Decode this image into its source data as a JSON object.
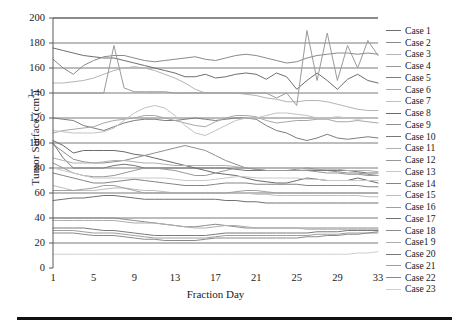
{
  "chart_data": {
    "type": "line",
    "title": "",
    "xlabel": "Fraction Day",
    "ylabel": "Tumor Surface (cm2)",
    "ylabel_display": "Tumor Surface (cm",
    "ylabel_sup": "2",
    "ylabel_tail": ")",
    "xlim": [
      1,
      33
    ],
    "ylim": [
      0,
      200
    ],
    "grid": true,
    "grid_orientation": "horizontal",
    "legend_position": "right",
    "x_ticks": [
      1,
      5,
      9,
      13,
      17,
      21,
      25,
      29,
      33
    ],
    "y_ticks": [
      0,
      20,
      40,
      60,
      80,
      100,
      120,
      140,
      160,
      180,
      200
    ],
    "x": [
      1,
      2,
      3,
      4,
      5,
      6,
      7,
      8,
      9,
      10,
      11,
      12,
      13,
      14,
      15,
      16,
      17,
      18,
      19,
      20,
      21,
      22,
      23,
      24,
      25,
      26,
      27,
      28,
      29,
      30,
      31,
      32,
      33
    ],
    "series": [
      {
        "name": "Case 1",
        "color": "#6e6e6e",
        "values": [
          176,
          174,
          172,
          170,
          169,
          168,
          168,
          166,
          164,
          162,
          160,
          158,
          156,
          153,
          153,
          155,
          152,
          153,
          155,
          156,
          155,
          151,
          156,
          153,
          143,
          150,
          156,
          150,
          143,
          151,
          155,
          150,
          148
        ]
      },
      {
        "name": "Case 2",
        "color": "#8a8a8a",
        "values": [
          167,
          160,
          155,
          162,
          166,
          169,
          170,
          170,
          168,
          166,
          165,
          166,
          167,
          168,
          169,
          167,
          166,
          168,
          170,
          171,
          170,
          168,
          166,
          164,
          165,
          168,
          170,
          171,
          172,
          172,
          171,
          172,
          171
        ]
      },
      {
        "name": "Case 3",
        "color": "#b4b4b4",
        "values": [
          148,
          148,
          149,
          150,
          152,
          155,
          158,
          160,
          161,
          160,
          158,
          155,
          152,
          148,
          143,
          140,
          140,
          140,
          140,
          139,
          138,
          136,
          135,
          133,
          133,
          134,
          134,
          133,
          131,
          129,
          127,
          126,
          126
        ]
      },
      {
        "name": "Case 4",
        "color": "#9a9a9a",
        "values": [
          140,
          140,
          140,
          140,
          140,
          140,
          178,
          144,
          141,
          141,
          141,
          141,
          140,
          140,
          140,
          140,
          140,
          140,
          140,
          140,
          140,
          140,
          136,
          140,
          130,
          190,
          150,
          188,
          150,
          178,
          160,
          182,
          170
        ]
      },
      {
        "name": "Case 5",
        "color": "#7d7d7d",
        "values": [
          120,
          119,
          118,
          114,
          112,
          110,
          113,
          116,
          118,
          119,
          119,
          118,
          118,
          119,
          120,
          119,
          118,
          119,
          120,
          120,
          119,
          114,
          110,
          108,
          104,
          102,
          104,
          107,
          104,
          103,
          104,
          105,
          104
        ]
      },
      {
        "name": "Case 6",
        "color": "#a8a8a8",
        "values": [
          108,
          110,
          111,
          112,
          113,
          116,
          118,
          119,
          120,
          122,
          122,
          120,
          118,
          116,
          114,
          113,
          117,
          120,
          122,
          122,
          121,
          118,
          116,
          117,
          118,
          118,
          119,
          119,
          117,
          117,
          118,
          117,
          116
        ]
      },
      {
        "name": "Case 7",
        "color": "#c2c2c2",
        "values": [
          110,
          109,
          108,
          108,
          108,
          109,
          112,
          118,
          124,
          128,
          130,
          128,
          122,
          114,
          108,
          106,
          110,
          114,
          118,
          120,
          120,
          122,
          124,
          124,
          123,
          122,
          120,
          120,
          121,
          120,
          119,
          120,
          120
        ]
      },
      {
        "name": "Case 8",
        "color": "#6a6a6a",
        "values": [
          102,
          98,
          92,
          94,
          94,
          94,
          94,
          93,
          91,
          90,
          88,
          86,
          84,
          82,
          80,
          78,
          76,
          75,
          74,
          72,
          70,
          69,
          68,
          68,
          70,
          72,
          71,
          70,
          70,
          70,
          72,
          70,
          68
        ]
      },
      {
        "name": "Case 9",
        "color": "#8f8f8f",
        "values": [
          99,
          93,
          87,
          85,
          84,
          84,
          85,
          86,
          88,
          90,
          92,
          94,
          96,
          98,
          96,
          94,
          90,
          86,
          83,
          80,
          79,
          78,
          78,
          78,
          79,
          80,
          79,
          78,
          77,
          76,
          76,
          75,
          74
        ]
      },
      {
        "name": "Case 10",
        "color": "#777777",
        "values": [
          100,
          88,
          80,
          80,
          80,
          80,
          82,
          83,
          82,
          80,
          80,
          80,
          80,
          80,
          80,
          80,
          80,
          80,
          79,
          78,
          78,
          78,
          78,
          78,
          78,
          78,
          78,
          78,
          78,
          78,
          77,
          76,
          76
        ]
      },
      {
        "name": "Case 11",
        "color": "#b0b0b0",
        "values": [
          88,
          86,
          84,
          84,
          84,
          85,
          86,
          86,
          85,
          84,
          84,
          83,
          82,
          82,
          82,
          82,
          82,
          82,
          81,
          80,
          80,
          80,
          80,
          80,
          80,
          79,
          79,
          79,
          79,
          78,
          78,
          78,
          77
        ]
      },
      {
        "name": "Case 12",
        "color": "#989898",
        "values": [
          84,
          80,
          76,
          74,
          73,
          73,
          74,
          76,
          78,
          80,
          80,
          79,
          78,
          76,
          74,
          74,
          76,
          78,
          80,
          80,
          79,
          78,
          78,
          78,
          78,
          78,
          77,
          76,
          76,
          75,
          75,
          74,
          74
        ]
      },
      {
        "name": "Case 13",
        "color": "#c8c8c8",
        "values": [
          80,
          78,
          76,
          74,
          72,
          72,
          72,
          72,
          72,
          72,
          72,
          72,
          71,
          70,
          70,
          70,
          71,
          72,
          73,
          73,
          72,
          72,
          72,
          72,
          72,
          71,
          71,
          70,
          70,
          70,
          70,
          70,
          70
        ]
      },
      {
        "name": "Case 14",
        "color": "#858585",
        "values": [
          76,
          74,
          72,
          70,
          68,
          68,
          69,
          70,
          71,
          70,
          69,
          68,
          67,
          66,
          66,
          66,
          67,
          68,
          68,
          68,
          67,
          67,
          67,
          67,
          67,
          66,
          66,
          66,
          66,
          66,
          66,
          65,
          65
        ]
      },
      {
        "name": "Case 15",
        "color": "#bdbdbd",
        "values": [
          66,
          64,
          62,
          62,
          62,
          63,
          64,
          64,
          63,
          62,
          62,
          61,
          60,
          60,
          60,
          60,
          60,
          60,
          60,
          60,
          59,
          59,
          58,
          58,
          58,
          58,
          58,
          58,
          58,
          58,
          58,
          57,
          57
        ]
      },
      {
        "name": "Case 16",
        "color": "#a0a0a0",
        "values": [
          62,
          62,
          62,
          63,
          64,
          66,
          66,
          64,
          62,
          60,
          60,
          60,
          60,
          60,
          60,
          60,
          60,
          60,
          61,
          62,
          62,
          61,
          60,
          60,
          60,
          60,
          60,
          60,
          60,
          60,
          60,
          60,
          60
        ]
      },
      {
        "name": "Case 17",
        "color": "#707070",
        "values": [
          54,
          55,
          56,
          56,
          57,
          58,
          58,
          57,
          56,
          55,
          55,
          55,
          55,
          55,
          55,
          55,
          55,
          54,
          54,
          53,
          53,
          52,
          52,
          52,
          52,
          52,
          52,
          52,
          52,
          52,
          52,
          52,
          52
        ]
      },
      {
        "name": "Case 18",
        "color": "#8c8c8c",
        "values": [
          40,
          40,
          40,
          40,
          40,
          40,
          40,
          39,
          38,
          37,
          36,
          35,
          34,
          33,
          33,
          34,
          35,
          34,
          33,
          32,
          32,
          32,
          32,
          32,
          32,
          32,
          32,
          32,
          32,
          32,
          32,
          32,
          32
        ]
      },
      {
        "name": "Case1 9",
        "color": "#aeaeae",
        "values": [
          38,
          38,
          38,
          38,
          38,
          38,
          38,
          37,
          36,
          36,
          36,
          35,
          34,
          33,
          32,
          32,
          33,
          34,
          34,
          33,
          32,
          32,
          32,
          32,
          32,
          31,
          31,
          31,
          31,
          31,
          31,
          31,
          31
        ]
      },
      {
        "name": "Case 20",
        "color": "#7a7a7a",
        "values": [
          32,
          32,
          32,
          32,
          31,
          30,
          30,
          29,
          28,
          27,
          26,
          26,
          26,
          26,
          26,
          26,
          27,
          28,
          28,
          28,
          28,
          28,
          28,
          28,
          28,
          28,
          29,
          29,
          29,
          30,
          30,
          30,
          30
        ]
      },
      {
        "name": "Case 21",
        "color": "#9e9e9e",
        "values": [
          30,
          30,
          30,
          29,
          28,
          28,
          28,
          27,
          26,
          25,
          24,
          24,
          24,
          24,
          24,
          24,
          25,
          26,
          26,
          26,
          26,
          26,
          26,
          26,
          26,
          26,
          27,
          27,
          27,
          28,
          28,
          28,
          28
        ]
      },
      {
        "name": "Case 22",
        "color": "#8a8a8a",
        "values": [
          28,
          28,
          28,
          27,
          26,
          26,
          26,
          25,
          24,
          23,
          23,
          22,
          22,
          22,
          22,
          23,
          24,
          24,
          24,
          24,
          24,
          24,
          24,
          24,
          24,
          25,
          25,
          26,
          26,
          27,
          27,
          28,
          29
        ]
      },
      {
        "name": "Case 23",
        "color": "#cfcfcf",
        "values": [
          11,
          11,
          11,
          11,
          11,
          11,
          11,
          11,
          11,
          11,
          11,
          11,
          11,
          11,
          11,
          11,
          11,
          11,
          11,
          11,
          11,
          11,
          11,
          11,
          11,
          11,
          11,
          11,
          11,
          11,
          12,
          12,
          13
        ]
      }
    ]
  },
  "axis": {
    "y_title_main": "Tumor Surface (cm",
    "y_title_sup": "2",
    "y_title_tail": ")",
    "x_title": "Fraction Day"
  },
  "colors": {
    "axis_line": "#5a5a5a",
    "grid_line": "#6b6b6b",
    "text": "#1a1a1a",
    "bottom_rule": "#111111"
  }
}
